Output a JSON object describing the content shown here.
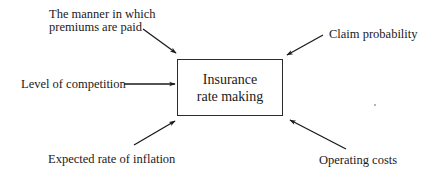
{
  "diagram": {
    "center": {
      "line1": "Insurance",
      "line2": "rate making"
    },
    "factors": [
      {
        "id": "premium-payment",
        "line1": "The manner in which",
        "line2": "premiums are paid",
        "position": "top-left"
      },
      {
        "id": "claim-probability",
        "label": "Claim probability",
        "position": "top-right"
      },
      {
        "id": "competition",
        "label": "Level of competition",
        "position": "left"
      },
      {
        "id": "inflation",
        "label": "Expected rate of inflation",
        "position": "bottom-left"
      },
      {
        "id": "operating-costs",
        "label": "Operating costs",
        "position": "bottom-right"
      }
    ],
    "colors": {
      "line": "#1a1a1a",
      "text": "#1a1a1a",
      "background": "#ffffff"
    }
  }
}
